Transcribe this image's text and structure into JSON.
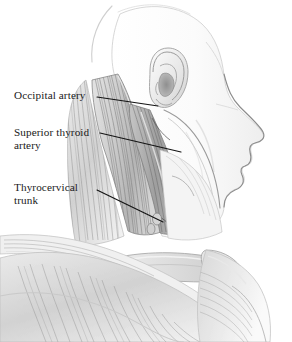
{
  "figure": {
    "background_color": "#ffffff",
    "ink_color": "#1a1a1a",
    "width": 292,
    "height": 342
  },
  "labels": [
    {
      "id": "occipital-artery",
      "text": "Occipital artery",
      "lines": [
        "Occipital artery"
      ],
      "x": 14,
      "y": 89,
      "leader": {
        "x1": 97,
        "y1": 97,
        "x2": 158,
        "y2": 106
      }
    },
    {
      "id": "superior-thyroid-artery",
      "text": "Superior thyroid\nartery",
      "lines": [
        "Superior thyroid",
        "artery"
      ],
      "x": 14,
      "y": 126,
      "leader": {
        "x1": 100,
        "y1": 133,
        "x2": 181,
        "y2": 152
      }
    },
    {
      "id": "thyrocervical-trunk",
      "text": "Thyrocervical\ntrunk",
      "lines": [
        "Thyrocervical",
        "trunk"
      ],
      "x": 14,
      "y": 181,
      "leader": {
        "x1": 97,
        "y1": 190,
        "x2": 163,
        "y2": 222
      }
    }
  ],
  "anatomy_regions": [
    {
      "name": "skull-outline",
      "description": "faint cranial vault contour, upper left of head"
    },
    {
      "name": "ear",
      "description": "external ear (auricle) with helix, antihelix and concha"
    },
    {
      "name": "face-profile",
      "description": "forehead, nose, lips and chin in right-facing profile"
    },
    {
      "name": "mandible",
      "description": "jaw line sweeping down from ear toward chin"
    },
    {
      "name": "sternocleidomastoid",
      "description": "large striated neck muscle running down-forward"
    },
    {
      "name": "posterior-neck-muscles",
      "description": "splenius and trapezius fibers at back of neck"
    },
    {
      "name": "clavicle",
      "description": "collarbone crossing lower neck"
    },
    {
      "name": "trapezius-shoulder",
      "description": "fan of shoulder muscle fibers at lower left"
    },
    {
      "name": "pectoral-chest",
      "description": "upper chest mass at lower right"
    }
  ]
}
